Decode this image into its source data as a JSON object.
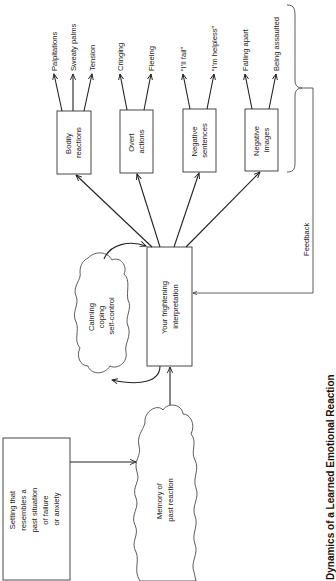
{
  "diagram": {
    "title": "Dynamics of a Learned Emotional Reaction",
    "orientation": "rotated 90 degrees clockwise (text reads bottom-to-top)",
    "nodes": {
      "setting": {
        "lines": [
          "Setting that",
          "resembles a",
          "past situation",
          "of failure",
          "or anxiety"
        ],
        "shape": "box"
      },
      "memory": {
        "lines": [
          "Memory of",
          "past reaction"
        ],
        "shape": "cloud"
      },
      "calming": {
        "lines": [
          "Calming",
          "coping",
          "self-control"
        ],
        "shape": "cloud"
      },
      "interpretation": {
        "lines": [
          "Your frightening",
          "interpretation"
        ],
        "shape": "box"
      },
      "bodily": {
        "lines": [
          "Bodily",
          "reactions"
        ],
        "shape": "box",
        "outputs": [
          "Palpitations",
          "Sweaty palms",
          "Tension"
        ]
      },
      "overt": {
        "lines": [
          "Overt",
          "actions"
        ],
        "shape": "box",
        "outputs": [
          "Cringing",
          "Fleeing"
        ]
      },
      "sentences": {
        "lines": [
          "Negative",
          "sentences"
        ],
        "shape": "box",
        "outputs": [
          "“I’ll fail”",
          "“I’m helpless”"
        ]
      },
      "images": {
        "lines": [
          "Negative",
          "images"
        ],
        "shape": "box",
        "outputs": [
          "Falling apart",
          "Being assaulted"
        ]
      }
    },
    "feedback_label": "Feedback",
    "edges": [
      [
        "setting",
        "memory"
      ],
      [
        "memory",
        "interpretation"
      ],
      [
        "calming",
        "interpretation"
      ],
      [
        "interpretation",
        "calming"
      ],
      [
        "interpretation",
        "bodily"
      ],
      [
        "interpretation",
        "overt"
      ],
      [
        "interpretation",
        "sentences"
      ],
      [
        "interpretation",
        "images"
      ],
      [
        "outputs-brace",
        "interpretation",
        "Feedback"
      ]
    ],
    "colors": {
      "ink": "#222222",
      "background": "#ffffff"
    }
  }
}
